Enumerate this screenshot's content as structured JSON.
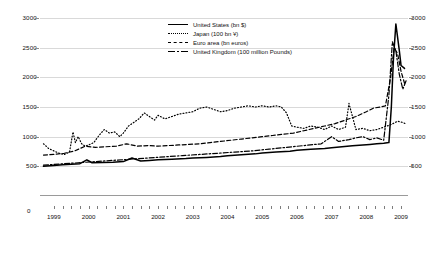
{
  "chart_data": {
    "type": "line",
    "title": "",
    "xlabel": "",
    "ylabel": "",
    "ylim": [
      0,
      3000
    ],
    "yticks": [
      500,
      1000,
      1500,
      2000,
      2500,
      3000
    ],
    "y_axis_zero_label": "0",
    "dual_axis": true,
    "right_yticks": [
      500,
      1000,
      1500,
      2000,
      2500,
      3000
    ],
    "grid": true,
    "legend_position": "top-center",
    "xticks": [
      "1999",
      "2000",
      "2001",
      "2002",
      "2003",
      "2004",
      "2005",
      "2006",
      "2007",
      "2008",
      "2009"
    ],
    "x_minor_ticks_per_year": 4,
    "xlim": [
      "1998.6",
      "2009.2"
    ],
    "series": [
      {
        "name": "United States (bn $)",
        "style": "solid",
        "color": "#000000",
        "x": [
          1998.7,
          1999.0,
          1999.25,
          1999.5,
          1999.75,
          1999.95,
          2000.1,
          2000.4,
          2000.7,
          2001.0,
          2001.25,
          2001.5,
          2001.75,
          2002.0,
          2002.4,
          2002.8,
          2003.0,
          2003.4,
          2003.8,
          2004.0,
          2004.4,
          2004.8,
          2005.0,
          2005.4,
          2005.8,
          2006.0,
          2006.4,
          2006.8,
          2007.0,
          2007.3,
          2007.6,
          2007.9,
          2008.1,
          2008.3,
          2008.5,
          2008.65,
          2008.72,
          2008.78,
          2008.85,
          2008.95,
          2009.0,
          2009.1
        ],
        "y": [
          500,
          515,
          525,
          535,
          545,
          610,
          560,
          565,
          570,
          580,
          640,
          590,
          600,
          610,
          620,
          630,
          640,
          650,
          665,
          680,
          695,
          710,
          725,
          740,
          755,
          770,
          790,
          800,
          815,
          830,
          845,
          860,
          870,
          880,
          890,
          900,
          1500,
          2300,
          2900,
          2450,
          2200,
          2150
        ],
        "annotations": [
          "Y2K spike end-1999",
          "Sharp expansion autumn 2008"
        ]
      },
      {
        "name": "Japan (100 bn ¥)",
        "style": "dotted",
        "color": "#000000",
        "x": [
          1998.7,
          1998.85,
          1999.0,
          1999.15,
          1999.3,
          1999.45,
          1999.55,
          1999.62,
          1999.7,
          1999.8,
          1999.9,
          2000.0,
          2000.15,
          2000.3,
          2000.45,
          2000.6,
          2000.75,
          2000.9,
          2001.0,
          2001.15,
          2001.3,
          2001.45,
          2001.6,
          2001.75,
          2001.9,
          2002.0,
          2002.2,
          2002.4,
          2002.6,
          2002.8,
          2003.0,
          2003.2,
          2003.4,
          2003.6,
          2003.8,
          2004.0,
          2004.2,
          2004.4,
          2004.6,
          2004.8,
          2005.0,
          2005.2,
          2005.4,
          2005.55,
          2005.7,
          2005.85,
          2006.0,
          2006.2,
          2006.4,
          2006.6,
          2006.8,
          2007.0,
          2007.2,
          2007.4,
          2007.5,
          2007.7,
          2007.9,
          2008.1,
          2008.3,
          2008.5,
          2008.7,
          2008.9,
          2009.05,
          2009.15
        ],
        "y": [
          880,
          800,
          760,
          720,
          700,
          740,
          1080,
          900,
          1000,
          880,
          840,
          860,
          900,
          1020,
          1120,
          1060,
          1080,
          1000,
          1060,
          1180,
          1240,
          1300,
          1400,
          1340,
          1280,
          1360,
          1300,
          1340,
          1380,
          1400,
          1420,
          1480,
          1500,
          1460,
          1420,
          1440,
          1480,
          1500,
          1520,
          1500,
          1520,
          1500,
          1520,
          1500,
          1400,
          1180,
          1160,
          1140,
          1180,
          1160,
          1120,
          1180,
          1120,
          1160,
          1560,
          1120,
          1140,
          1100,
          1120,
          1160,
          1200,
          1260,
          1240,
          1210
        ],
        "annotations": [
          "Quantitative easing peak ~1500 (2005)",
          "Exit from QE in 2006"
        ]
      },
      {
        "name": "Euro area (bn euros)",
        "style": "dashed",
        "color": "#000000",
        "x": [
          1998.7,
          1999.0,
          1999.3,
          1999.6,
          1999.9,
          2000.2,
          2000.5,
          2000.8,
          2001.1,
          2001.4,
          2001.7,
          2002.0,
          2002.3,
          2002.6,
          2002.9,
          2003.2,
          2003.5,
          2003.8,
          2004.1,
          2004.4,
          2004.7,
          2005.0,
          2005.3,
          2005.6,
          2005.9,
          2006.2,
          2006.5,
          2006.8,
          2007.1,
          2007.4,
          2007.7,
          2008.0,
          2008.2,
          2008.4,
          2008.55,
          2008.7,
          2008.8,
          2008.9,
          2009.0,
          2009.1
        ],
        "y": [
          690,
          700,
          720,
          760,
          840,
          820,
          830,
          840,
          880,
          840,
          850,
          840,
          850,
          860,
          870,
          880,
          900,
          920,
          940,
          960,
          980,
          1000,
          1020,
          1040,
          1060,
          1100,
          1140,
          1180,
          1220,
          1280,
          1340,
          1420,
          1480,
          1500,
          1520,
          2000,
          2500,
          2400,
          2100,
          1900
        ],
        "annotations": [
          "Large liquidity expansion autumn 2008"
        ]
      },
      {
        "name": "United Kingdom (100 million Pounds)",
        "style": "dashdot",
        "color": "#000000",
        "x": [
          1998.7,
          1999.2,
          1999.7,
          2000.2,
          2000.7,
          2001.2,
          2001.7,
          2002.2,
          2002.7,
          2003.2,
          2003.7,
          2004.2,
          2004.7,
          2005.2,
          2005.7,
          2006.2,
          2006.7,
          2007.0,
          2007.2,
          2007.5,
          2007.7,
          2007.9,
          2008.1,
          2008.3,
          2008.5,
          2008.65,
          2008.75,
          2008.85,
          2008.95,
          2009.05,
          2009.15
        ],
        "y": [
          520,
          540,
          560,
          580,
          600,
          620,
          640,
          660,
          680,
          700,
          720,
          740,
          760,
          790,
          820,
          850,
          880,
          1000,
          920,
          950,
          980,
          1000,
          950,
          980,
          940,
          1700,
          2600,
          2450,
          2050,
          1800,
          1950
        ],
        "annotations": [
          "Sharp increase from late 2008"
        ]
      }
    ]
  }
}
